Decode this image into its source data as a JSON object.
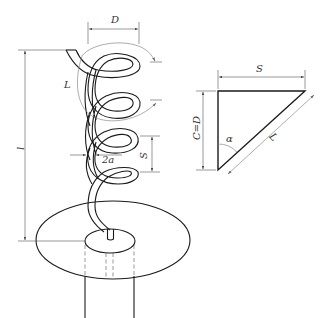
{
  "figure": {
    "type": "engineering-diagram",
    "line_color": "#1a1a1a",
    "dimension_color": "#555555",
    "background": "#ffffff"
  },
  "helix": {
    "labels": {
      "diameter": "D",
      "wire_length": "L",
      "total_height": "l",
      "pitch": "S",
      "wire_thickness": "2a"
    },
    "turns": 4
  },
  "triangle": {
    "labels": {
      "base": "S",
      "height": "C=D",
      "hypotenuse": "L",
      "angle": "α"
    }
  }
}
